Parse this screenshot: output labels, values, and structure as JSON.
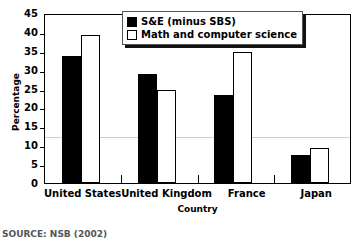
{
  "chart_data": {
    "type": "bar",
    "title": "",
    "xlabel": "Country",
    "ylabel": "Percentage",
    "categories": [
      "United States",
      "United Kingdom",
      "France",
      "Japan"
    ],
    "series": [
      {
        "name": "S&E (minus SBS)",
        "color": "#000000",
        "values": [
          33.7,
          28.9,
          23.2,
          7.5
        ]
      },
      {
        "name": "Math and computer science",
        "color": "#ffffff",
        "values": [
          39.3,
          24.6,
          34.7,
          9.2
        ]
      }
    ],
    "ylim": [
      0,
      45
    ],
    "yticks": [
      0,
      5,
      10,
      15,
      20,
      25,
      30,
      35,
      40,
      45
    ],
    "ytick_labels": [
      "0",
      "5",
      "10",
      "15",
      "20",
      "25",
      "30",
      "35",
      "40",
      "45"
    ],
    "gridlines": [
      12.8
    ],
    "grid": "partial",
    "legend_position": "top-right"
  },
  "legend": {
    "entries": [
      {
        "label": "S&E (minus SBS)",
        "swatch": "dark"
      },
      {
        "label": "Math and computer science",
        "swatch": "light"
      }
    ]
  },
  "source": {
    "text": "SOURCE: NSB (2002)"
  }
}
